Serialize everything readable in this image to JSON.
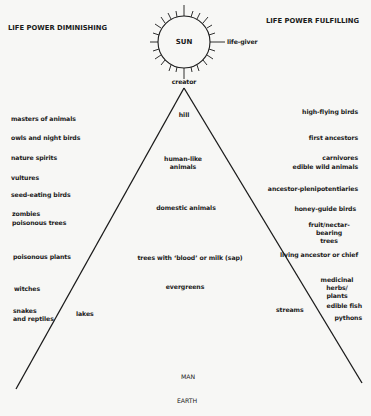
{
  "headers": {
    "left": "LIFE POWER DIMINISHING",
    "right": "LIFE POWER FULFILLING"
  },
  "sun": {
    "label": "SUN",
    "right_label": "life-giver",
    "bottom_label": "creator"
  },
  "axis": {
    "top": "MAN",
    "bottom": "EARTH"
  },
  "center_items": [
    "hill",
    "human-like\nanimals",
    "domestic animals",
    "trees with ‘blood’ or milk (sap)",
    "evergreens"
  ],
  "left_items": [
    "masters of animals",
    "owls and night birds",
    "nature spirits",
    "vultures",
    "seed-eating birds",
    "zombies",
    "poisonous trees",
    "poisonous plants",
    "witches",
    "snakes\nand reptiles",
    "lakes"
  ],
  "right_items": [
    "high-flying birds",
    "first ancestors",
    "carnivores",
    "edible wild animals",
    "ancestor-plenipotentiaries",
    "honey-guide birds",
    "fruit/nectar-bearing\ntrees",
    "living ancestor or chief",
    "medicinal herbs/\nplants",
    "edible fish",
    "pythons",
    "streams"
  ],
  "colors": {
    "background": "#f7f7f5",
    "ink": "#1a1a1a"
  }
}
